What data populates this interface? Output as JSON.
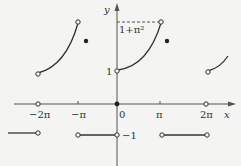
{
  "diagram": {
    "axes": {
      "x_label": "x",
      "y_label": "y",
      "origin_label": "0"
    },
    "x_ticks": [
      {
        "label": "−2π",
        "x": 38
      },
      {
        "label": "−π",
        "x": 78
      },
      {
        "label": "π",
        "x": 160
      },
      {
        "label": "2π",
        "x": 206
      }
    ],
    "y_ticks": [
      {
        "label": "1",
        "y": 71
      },
      {
        "label": "1+π²",
        "y": 22
      },
      {
        "label": "−1",
        "y": 134
      }
    ],
    "colors": {
      "curve": "#333333",
      "background": "#f4f4f2"
    }
  }
}
